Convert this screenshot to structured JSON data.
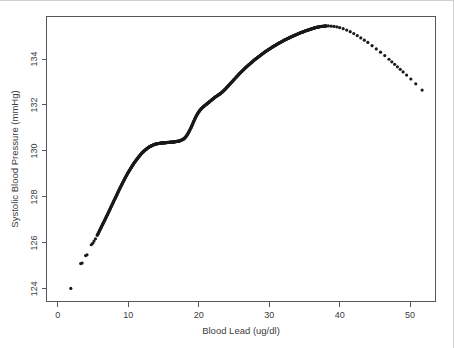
{
  "figure": {
    "type": "scatter-smooth-curve",
    "background_color": "#ffffff",
    "axis_color": "#55575a",
    "point_color": "#1a1a1a"
  },
  "chart_data": {
    "type": "scatter",
    "title": "",
    "subtitle": "",
    "xlabel": "Blood Lead (ug/dl)",
    "ylabel": "Systolic Blood Pressure (mmHg)",
    "xlim": [
      -1.6,
      53.6
    ],
    "ylim": [
      123.45,
      135.85
    ],
    "xticks": [
      0,
      10,
      20,
      30,
      40,
      50
    ],
    "xtick_labels": [
      "0",
      "10",
      "20",
      "30",
      "40",
      "50"
    ],
    "yticks": [
      124,
      126,
      128,
      130,
      132,
      134
    ],
    "ytick_labels": [
      "124",
      "126",
      "128",
      "130",
      "132",
      "134"
    ],
    "grid": false,
    "legend": null,
    "annotations": [],
    "series": [
      {
        "name": "Smoothed systolic blood pressure vs blood lead",
        "marker": "dot",
        "marker_size": 1.6,
        "x": [
          1.85,
          3.25,
          3.45,
          3.95,
          4.15,
          4.75,
          4.95,
          5.15,
          5.35,
          5.6,
          5.8,
          6.0,
          6.2,
          6.4,
          6.6,
          6.8,
          7.0,
          7.2,
          7.4,
          7.6,
          7.8,
          8.0,
          8.2,
          8.4,
          8.6,
          8.8,
          9.0,
          9.2,
          9.4,
          9.6,
          9.8,
          10.0,
          10.2,
          10.4,
          10.6,
          10.8,
          11.0,
          11.2,
          11.4,
          11.6,
          11.8,
          12.0,
          12.2,
          12.4,
          12.6,
          12.8,
          13.0,
          13.2,
          13.4,
          13.6,
          13.8,
          14.0,
          14.2,
          14.4,
          14.6,
          14.8,
          15.0,
          15.2,
          15.4,
          15.6,
          15.8,
          16.0,
          16.2,
          16.4,
          16.6,
          16.8,
          17.0,
          17.2,
          17.4,
          17.6,
          17.8,
          18.0,
          18.2,
          18.4,
          18.6,
          18.8,
          19.0,
          19.2,
          19.4,
          19.6,
          19.8,
          20.0,
          20.2,
          20.4,
          20.6,
          20.8,
          21.0,
          21.2,
          21.4,
          21.6,
          21.8,
          22.0,
          22.2,
          22.4,
          22.6,
          22.8,
          23.0,
          23.2,
          23.4,
          23.6,
          23.8,
          24.0,
          24.3,
          24.6,
          24.9,
          25.2,
          25.5,
          25.8,
          26.1,
          26.4,
          26.7,
          27.0,
          27.3,
          27.6,
          27.9,
          28.2,
          28.5,
          28.8,
          29.1,
          29.4,
          29.7,
          30.0,
          30.3,
          30.6,
          30.9,
          31.2,
          31.5,
          31.8,
          32.1,
          32.4,
          32.7,
          33.0,
          33.3,
          33.6,
          33.9,
          34.2,
          34.5,
          34.8,
          35.1,
          35.4,
          35.7,
          36.0,
          36.3,
          36.6,
          36.9,
          37.2,
          37.5,
          37.8,
          38.1,
          38.4,
          38.8,
          39.2,
          39.6,
          40.0,
          40.5,
          41.0,
          41.5,
          42.0,
          42.5,
          43.0,
          43.5,
          44.0,
          44.6,
          45.2,
          45.8,
          46.4,
          47.0,
          47.4,
          47.8,
          48.2,
          48.6,
          49.0,
          49.5,
          50.1,
          50.8,
          51.7
        ],
        "y": [
          124.02,
          125.1,
          125.12,
          125.45,
          125.48,
          125.92,
          125.98,
          126.08,
          126.18,
          126.33,
          126.45,
          126.58,
          126.7,
          126.83,
          126.95,
          127.08,
          127.2,
          127.33,
          127.46,
          127.59,
          127.72,
          127.85,
          127.98,
          128.11,
          128.24,
          128.37,
          128.49,
          128.61,
          128.73,
          128.85,
          128.96,
          129.07,
          129.17,
          129.27,
          129.37,
          129.46,
          129.55,
          129.63,
          129.71,
          129.79,
          129.86,
          129.93,
          129.99,
          130.04,
          130.09,
          130.14,
          130.18,
          130.21,
          130.24,
          130.27,
          130.29,
          130.31,
          130.32,
          130.33,
          130.34,
          130.35,
          130.35,
          130.36,
          130.36,
          130.37,
          130.37,
          130.38,
          130.38,
          130.39,
          130.4,
          130.41,
          130.42,
          130.43,
          130.45,
          130.48,
          130.51,
          130.56,
          130.63,
          130.72,
          130.83,
          130.95,
          131.08,
          131.22,
          131.36,
          131.49,
          131.6,
          131.7,
          131.78,
          131.85,
          131.91,
          131.96,
          132.01,
          132.06,
          132.11,
          132.16,
          132.21,
          132.26,
          132.31,
          132.36,
          132.4,
          132.44,
          132.48,
          132.53,
          132.58,
          132.64,
          132.7,
          132.77,
          132.87,
          132.97,
          133.07,
          133.17,
          133.27,
          133.37,
          133.46,
          133.55,
          133.64,
          133.72,
          133.8,
          133.88,
          133.96,
          134.03,
          134.1,
          134.17,
          134.24,
          134.31,
          134.37,
          134.43,
          134.49,
          134.55,
          134.6,
          134.66,
          134.71,
          134.76,
          134.81,
          134.86,
          134.9,
          134.95,
          134.99,
          135.03,
          135.07,
          135.11,
          135.15,
          135.18,
          135.22,
          135.25,
          135.28,
          135.31,
          135.34,
          135.37,
          135.39,
          135.41,
          135.42,
          135.43,
          135.44,
          135.44,
          135.43,
          135.42,
          135.4,
          135.37,
          135.32,
          135.26,
          135.19,
          135.11,
          135.02,
          134.92,
          134.82,
          134.72,
          134.58,
          134.44,
          134.3,
          134.15,
          133.99,
          133.88,
          133.77,
          133.66,
          133.55,
          133.44,
          133.3,
          133.13,
          132.92,
          132.65
        ]
      }
    ]
  }
}
